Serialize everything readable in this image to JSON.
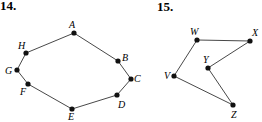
{
  "page": {
    "width": 262,
    "height": 122,
    "background": "#ffffff",
    "ink_color": "#1a1a1a"
  },
  "problems": [
    {
      "number_label": "14.",
      "number_pos": {
        "x": 0,
        "y": -1
      },
      "figure_name": "octagon-abcdefgh",
      "shape_type": "closed polygon",
      "vertex_count": 8,
      "vertices": [
        {
          "id": "A",
          "label": "A",
          "x": 74,
          "y": 33,
          "label_x": 69,
          "label_y": 20
        },
        {
          "id": "B",
          "label": "B",
          "x": 118,
          "y": 61,
          "label_x": 122,
          "label_y": 53
        },
        {
          "id": "C",
          "label": "C",
          "x": 131,
          "y": 79,
          "label_x": 134,
          "label_y": 74
        },
        {
          "id": "D",
          "label": "D",
          "x": 117,
          "y": 95,
          "label_x": 118,
          "label_y": 100
        },
        {
          "id": "E",
          "label": "E",
          "x": 72,
          "y": 109,
          "label_x": 68,
          "label_y": 112
        },
        {
          "id": "F",
          "label": "F",
          "x": 28,
          "y": 84,
          "label_x": 20,
          "label_y": 87
        },
        {
          "id": "G",
          "label": "G",
          "x": 17,
          "y": 70,
          "label_x": 5,
          "label_y": 66
        },
        {
          "id": "H",
          "label": "H",
          "x": 26,
          "y": 53,
          "label_x": 18,
          "label_y": 41
        }
      ],
      "edges": [
        {
          "from": "A",
          "to": "B"
        },
        {
          "from": "B",
          "to": "C"
        },
        {
          "from": "C",
          "to": "D"
        },
        {
          "from": "D",
          "to": "E"
        },
        {
          "from": "E",
          "to": "F"
        },
        {
          "from": "F",
          "to": "G"
        },
        {
          "from": "G",
          "to": "H"
        },
        {
          "from": "H",
          "to": "A"
        }
      ]
    },
    {
      "number_label": "15.",
      "number_pos": {
        "x": 157,
        "y": 0
      },
      "figure_name": "polygon-vwxyz",
      "shape_type": "closed polygon",
      "vertex_count": 5,
      "vertices": [
        {
          "id": "V",
          "label": "V",
          "x": 174,
          "y": 76,
          "label_x": 164,
          "label_y": 71
        },
        {
          "id": "W",
          "label": "W",
          "x": 197,
          "y": 40,
          "label_x": 190,
          "label_y": 27
        },
        {
          "id": "X",
          "label": "X",
          "x": 250,
          "y": 41,
          "label_x": 252,
          "label_y": 28
        },
        {
          "id": "Y",
          "label": "Y",
          "x": 208,
          "y": 68,
          "label_x": 203,
          "label_y": 55
        },
        {
          "id": "Z",
          "label": "Z",
          "x": 233,
          "y": 105,
          "label_x": 231,
          "label_y": 110
        }
      ],
      "edges": [
        {
          "from": "V",
          "to": "W"
        },
        {
          "from": "W",
          "to": "X"
        },
        {
          "from": "X",
          "to": "Y"
        },
        {
          "from": "Y",
          "to": "Z"
        },
        {
          "from": "Z",
          "to": "V"
        }
      ]
    }
  ],
  "style": {
    "vertex_radius": 2.6,
    "edge_width": 0.9,
    "vertex_fill": "#111111",
    "edge_stroke": "#333333"
  }
}
